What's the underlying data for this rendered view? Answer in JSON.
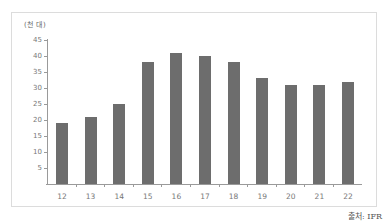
{
  "chart_data": {
    "type": "bar",
    "title": "",
    "unit_label": "(천 대)",
    "xlabel": "",
    "ylabel": "(천 대)",
    "categories": [
      "12",
      "13",
      "14",
      "15",
      "16",
      "17",
      "18",
      "19",
      "20",
      "21",
      "22"
    ],
    "values": [
      19,
      21,
      25,
      38,
      41,
      40,
      38,
      33,
      31,
      31,
      32
    ],
    "ylim": [
      0,
      45
    ],
    "yticks": [
      "45",
      "40",
      "35",
      "30",
      "25",
      "20",
      "15",
      "10",
      "5"
    ],
    "grid": false,
    "bar_color": "#6d6d6d",
    "source": "출처: IFR"
  }
}
